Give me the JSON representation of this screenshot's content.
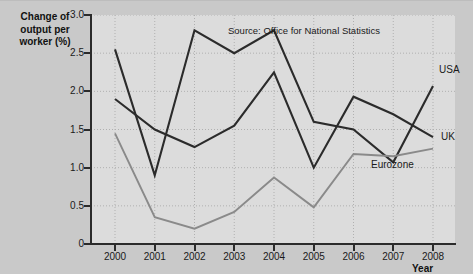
{
  "chart_data": {
    "type": "line",
    "title": "",
    "xlabel": "Year",
    "ylabel": "Change of output per worker (%)",
    "categories": [
      "2000",
      "2001",
      "2002",
      "2003",
      "2004",
      "2005",
      "2006",
      "2007",
      "2008"
    ],
    "ylim": [
      0,
      3.0
    ],
    "yticks": [
      0,
      0.5,
      1.0,
      1.5,
      2.0,
      2.5,
      3.0
    ],
    "ytick_labels": [
      "0",
      "0.5",
      "1.0",
      "1.5",
      "2.0",
      "2.5",
      "3.0"
    ],
    "grid": true,
    "legend_position": "inline-right",
    "annotation": "Source: Office for National Statistics",
    "series": [
      {
        "name": "USA",
        "color": "#2b2b2b",
        "values": [
          2.55,
          0.9,
          2.8,
          2.5,
          2.8,
          1.6,
          1.5,
          1.07,
          2.07
        ]
      },
      {
        "name": "UK",
        "color": "#2b2b2b",
        "values": [
          1.9,
          1.5,
          1.27,
          1.55,
          2.25,
          1.0,
          1.93,
          1.7,
          1.4
        ]
      },
      {
        "name": "Eurozone",
        "color": "#8a8a8a",
        "values": [
          1.45,
          0.35,
          0.2,
          0.42,
          0.87,
          0.48,
          1.18,
          1.15,
          1.25
        ]
      }
    ]
  },
  "colors": {
    "frame_background": "#c9c9c9",
    "plot_background": "#dcdcdc",
    "axis": "#2b2b2b",
    "grid": "#b0b0b0",
    "dark_series": "#2b2b2b",
    "light_series": "#8a8a8a"
  }
}
